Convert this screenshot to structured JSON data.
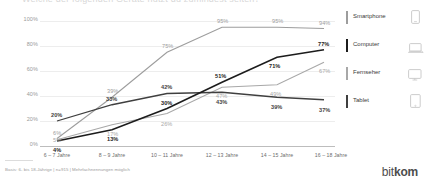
{
  "title": {
    "text_cutoff": "Welche der folgenden Geräte nutzt du zumindest selten?"
  },
  "chart_data": {
    "type": "line",
    "title": "Welche der folgenden Geräte nutzt du zumindest selten?",
    "xlabel": "",
    "ylabel": "",
    "ylim": [
      0,
      100
    ],
    "grid": true,
    "legend_position": "right",
    "categories": [
      "6 – 7 Jahre",
      "8 – 9 Jahre",
      "10 – 11 Jahre",
      "12 – 13 Jahre",
      "14 – 15 Jahre",
      "16 – 18 Jahre"
    ],
    "yticks": [
      "0%",
      "20%",
      "40%",
      "60%",
      "80%",
      "100%"
    ],
    "ytick_values": [
      0,
      20,
      40,
      60,
      80,
      100
    ],
    "series": [
      {
        "name": "Smartphone",
        "color": "#9d9d9d",
        "values": [
          6,
          39,
          75,
          95,
          95,
          94
        ],
        "labels": [
          "6%",
          "39%",
          "75%",
          "95%",
          "95%",
          "94%"
        ]
      },
      {
        "name": "Computer",
        "color": "#1c1c1c",
        "values": [
          4,
          13,
          30,
          51,
          71,
          77
        ],
        "labels": [
          "4%",
          "13%",
          "30%",
          "51%",
          "71%",
          "77%"
        ]
      },
      {
        "name": "Fernseher",
        "color": "#a8a8a8",
        "values": [
          5,
          17,
          26,
          47,
          49,
          67
        ],
        "labels": [
          "5%",
          "17%",
          "26%",
          "47%",
          "49%",
          "67%"
        ]
      },
      {
        "name": "Tablet",
        "color": "#3f3f3f",
        "values": [
          20,
          33,
          42,
          43,
          39,
          37
        ],
        "labels": [
          "20%",
          "33%",
          "42%",
          "43%",
          "39%",
          "37%"
        ]
      }
    ]
  },
  "legend": {
    "items": [
      {
        "label": "Smartphone",
        "color": "#9d9d9d",
        "icon": "smartphone-icon"
      },
      {
        "label": "Computer",
        "color": "#1c1c1c",
        "icon": "laptop-icon"
      },
      {
        "label": "Fernseher",
        "color": "#a8a8a8",
        "icon": "television-icon"
      },
      {
        "label": "Tablet",
        "color": "#3f3f3f",
        "icon": "tablet-icon"
      }
    ]
  },
  "footnote": {
    "text": "Basis: 6- bis 18-Jährige | n=915 | Mehrfachnennungen möglich"
  },
  "brand": {
    "name_light": "bit",
    "name_bold": "kom"
  }
}
